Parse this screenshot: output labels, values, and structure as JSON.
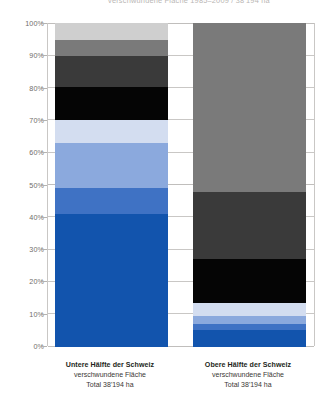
{
  "title": {
    "text": "verschwundene Fläche 1985–2009 / 38'194 ha",
    "clipped": true
  },
  "axis": {
    "ticks": [
      "100%",
      "90%",
      "80%",
      "70%",
      "60%",
      "50%",
      "40%",
      "30%",
      "20%",
      "10%",
      "0%"
    ],
    "min": 0,
    "max": 100,
    "unit": "%"
  },
  "columns": [
    {
      "id": "untere-haelfte",
      "title": "Untere Hälfte der Schweiz",
      "subtitle": "verschwundene Fläche",
      "total": "Total 38'194 ha"
    },
    {
      "id": "obere-haelfte",
      "title": "Obere Hälfte der Schweiz",
      "subtitle": "verschwundene Fläche",
      "total": "Total 38'194 ha"
    }
  ],
  "colors": {
    "strong_blue": "#1254ad",
    "medium_blue": "#3f72c4",
    "light_blue": "#8ba9dd",
    "pale_blue": "#d3ddf0",
    "black": "#050505",
    "dark_gray": "#3a3a3a",
    "medium_gray": "#7a7a7a",
    "light_gray": "#cfcfcf",
    "grid": "#c9c7c5",
    "tick_text": "#6f6c6a"
  },
  "chart_data": {
    "type": "bar",
    "subtype": "stacked-100-percent",
    "title": "verschwundene Fläche 1985–2009 / 38'194 ha",
    "xlabel": "",
    "ylabel": "",
    "ylim": [
      0,
      100
    ],
    "ytick_labels": [
      "0%",
      "10%",
      "20%",
      "30%",
      "40%",
      "50%",
      "60%",
      "70%",
      "80%",
      "90%",
      "100%"
    ],
    "grid": true,
    "legend": "none",
    "categories": [
      "Untere Hälfte der Schweiz",
      "Obere Hälfte der Schweiz"
    ],
    "series": [
      {
        "name": "Band 1 (strong blue)",
        "color": "#1254ad",
        "values": [
          41.0,
          5.0
        ]
      },
      {
        "name": "Band 2 (medium blue)",
        "color": "#3f72c4",
        "values": [
          8.0,
          2.0
        ]
      },
      {
        "name": "Band 3 (light blue)",
        "color": "#8ba9dd",
        "values": [
          14.0,
          2.5
        ]
      },
      {
        "name": "Band 4 (pale blue)",
        "color": "#d3ddf0",
        "values": [
          7.0,
          4.0
        ]
      },
      {
        "name": "Band 5 (black)",
        "color": "#050505",
        "values": [
          10.5,
          4.0
        ]
      },
      {
        "name": "Band 6 (dark gray)",
        "color": "#3a3a3a",
        "values": [
          9.5,
          13.5
        ]
      },
      {
        "name": "Band 7 (medium gray)",
        "color": "#7a7a7a",
        "values": [
          5.0,
          21.0
        ]
      },
      {
        "name": "Band 8 (light gray)",
        "color": "#cfcfcf",
        "values": [
          5.0,
          48.0
        ]
      }
    ],
    "stack_boundaries_percent": {
      "untere": [
        0,
        41.0,
        49.0,
        63.0,
        70.0,
        80.5,
        90.0,
        95.0,
        100.0
      ],
      "obere": [
        0,
        5.0,
        7.0,
        9.5,
        13.5,
        27.0,
        48.0,
        100.0
      ]
    },
    "annotations": [
      "Untere Hälfte der Schweiz — verschwundene Fläche — Total 38'194 ha",
      "Obere Hälfte der Schweiz — verschwundene Fläche — Total 38'194 ha"
    ]
  }
}
